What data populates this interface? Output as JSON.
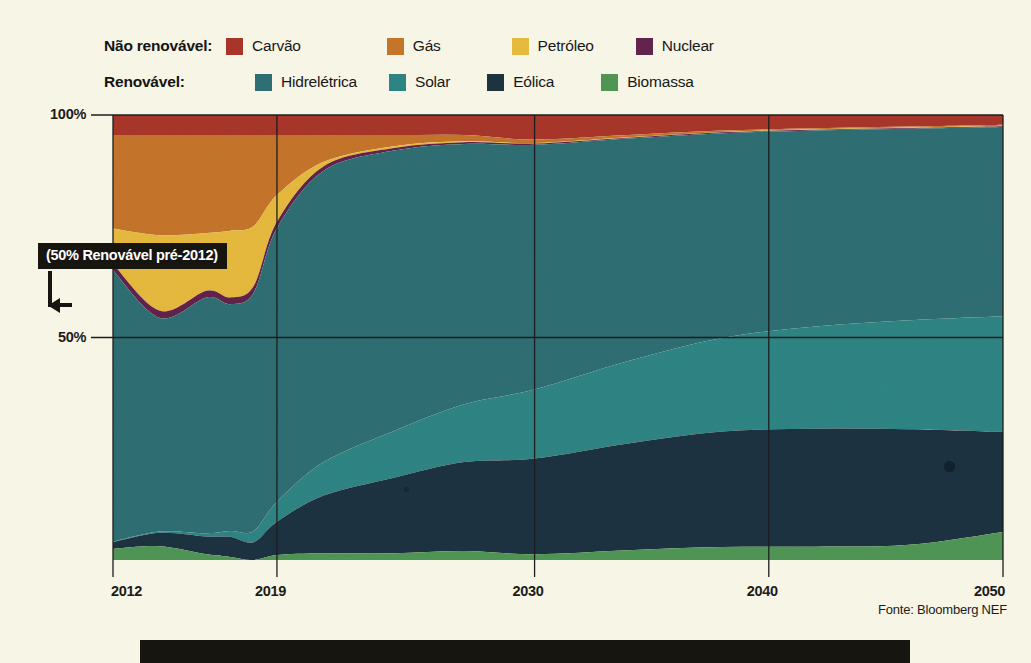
{
  "legend": {
    "rows": [
      {
        "group_label": "Não renovável:",
        "items": [
          {
            "label": "Carvão",
            "color": "#a8352a",
            "name": "coal"
          },
          {
            "label": "Gás",
            "color": "#c5752a",
            "name": "gas"
          },
          {
            "label": "Petróleo",
            "color": "#e6b93f",
            "name": "oil"
          },
          {
            "label": "Nuclear",
            "color": "#62234c",
            "name": "nuclear"
          }
        ]
      },
      {
        "group_label": "Renovável:",
        "items": [
          {
            "label": "Hidrelétrica",
            "color": "#2f6e73",
            "name": "hydro"
          },
          {
            "label": "Solar",
            "color": "#2e8484",
            "name": "solar"
          },
          {
            "label": "Eólica",
            "color": "#1e3340",
            "name": "wind"
          },
          {
            "label": "Biomassa",
            "color": "#4f9655",
            "name": "biomass"
          }
        ]
      }
    ]
  },
  "annotation": {
    "text": "(50% Renovável pré-2012)"
  },
  "source": {
    "text": "Fonte: Bloomberg NEF"
  },
  "chart_data": {
    "type": "area",
    "stacked": true,
    "normalized": true,
    "title": "",
    "subtitle": "",
    "xlabel": "",
    "ylabel": "",
    "xlim": [
      2012,
      2050
    ],
    "ylim": [
      0,
      100
    ],
    "ytick_labels": [
      "100%",
      "50%"
    ],
    "yticks": [
      100,
      50
    ],
    "xtick_labels": [
      "2012",
      "2019",
      "2030",
      "2040",
      "2050"
    ],
    "xticks": [
      2012,
      2019,
      2030,
      2040,
      2050
    ],
    "grid": true,
    "legend_position": "top",
    "units": "% da geração de eletricidade",
    "stack_order_top_to_bottom": [
      "Carvão",
      "Gás",
      "Petróleo",
      "Nuclear",
      "Hidrelétrica",
      "Solar",
      "Eólica",
      "Biomassa"
    ],
    "x": [
      2012,
      2014,
      2016,
      2017,
      2018,
      2019,
      2021,
      2024,
      2027,
      2030,
      2034,
      2038,
      2042,
      2046,
      2050
    ],
    "series": [
      {
        "name": "Carvão",
        "color": "#a8352a",
        "values": [
          4.5,
          4.5,
          4.5,
          4.5,
          4.5,
          4.5,
          4.5,
          4.5,
          4.5,
          5.5,
          4.5,
          3.5,
          3.0,
          2.6,
          2.2
        ]
      },
      {
        "name": "Gás",
        "color": "#c5752a",
        "values": [
          21.0,
          22.5,
          22.0,
          21.5,
          20.5,
          13.5,
          6.0,
          2.5,
          1.4,
          0.8,
          0.5,
          0.3,
          0.2,
          0.2,
          0.2
        ]
      },
      {
        "name": "Petróleo",
        "color": "#e6b93f",
        "values": [
          8.0,
          17.0,
          13.0,
          15.0,
          13.5,
          6.0,
          1.0,
          0.4,
          0.2,
          0.1,
          0.1,
          0.1,
          0.1,
          0.1,
          0.1
        ]
      },
      {
        "name": "Nuclear",
        "color": "#62234c",
        "values": [
          1.4,
          1.6,
          1.5,
          1.5,
          1.5,
          1.4,
          1.0,
          0.6,
          0.4,
          0.3,
          0.2,
          0.2,
          0.2,
          0.2,
          0.2
        ]
      },
      {
        "name": "Hidrelétrica",
        "color": "#2f6e73",
        "values": [
          61.0,
          48.0,
          53.0,
          51.0,
          53.5,
          61.5,
          65.5,
          63.0,
          58.5,
          55.0,
          50.0,
          46.0,
          44.0,
          43.0,
          42.5
        ]
      },
      {
        "name": "Solar",
        "color": "#2e8484",
        "values": [
          0.1,
          0.3,
          0.7,
          1.3,
          2.5,
          4.5,
          7.5,
          10.5,
          13.0,
          15.5,
          18.5,
          21.0,
          23.0,
          24.5,
          26.0
        ]
      },
      {
        "name": "Eólica",
        "color": "#1e3340",
        "values": [
          1.5,
          3.0,
          4.0,
          4.5,
          4.0,
          7.5,
          13.0,
          17.0,
          20.0,
          21.5,
          24.0,
          26.0,
          26.5,
          26.0,
          22.5
        ]
      },
      {
        "name": "Biomassa",
        "color": "#4f9655",
        "values": [
          2.5,
          3.1,
          1.3,
          0.7,
          0.0,
          1.1,
          1.5,
          1.5,
          2.0,
          1.3,
          2.2,
          2.9,
          3.0,
          3.4,
          6.3
        ]
      }
    ]
  }
}
